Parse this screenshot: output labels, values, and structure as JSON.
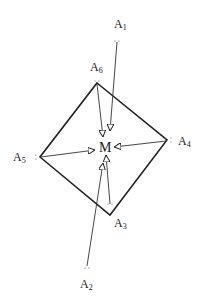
{
  "diagram": {
    "type": "directed-graph",
    "center": {
      "id": "M",
      "label": "M",
      "x": 105,
      "y": 148
    },
    "nodes": [
      {
        "id": "A1",
        "letter": "A",
        "sub": "1",
        "x": 117,
        "y": 41,
        "label_x": 114,
        "label_y": 18
      },
      {
        "id": "A2",
        "letter": "A",
        "sub": "2",
        "x": 87,
        "y": 268,
        "label_x": 80,
        "label_y": 278
      },
      {
        "id": "A3",
        "letter": "A",
        "sub": "3",
        "x": 110,
        "y": 215,
        "label_x": 114,
        "label_y": 217
      },
      {
        "id": "A4",
        "letter": "A",
        "sub": "4",
        "x": 167,
        "y": 140,
        "label_x": 178,
        "label_y": 135
      },
      {
        "id": "A5",
        "letter": "A",
        "sub": "5",
        "x": 40,
        "y": 157,
        "label_x": 13,
        "label_y": 151
      },
      {
        "id": "A6",
        "letter": "A",
        "sub": "6",
        "x": 97,
        "y": 83,
        "label_x": 90,
        "label_y": 61
      }
    ],
    "polygon": [
      "A6",
      "A4",
      "A3",
      "A5"
    ],
    "arrows": [
      {
        "from": "A1",
        "to": "M"
      },
      {
        "from": "A6",
        "to": "M"
      },
      {
        "from": "A4",
        "to": "M"
      },
      {
        "from": "A5",
        "to": "M"
      },
      {
        "from": "A3",
        "to": "M"
      },
      {
        "from": "A2",
        "to": "M"
      }
    ]
  }
}
